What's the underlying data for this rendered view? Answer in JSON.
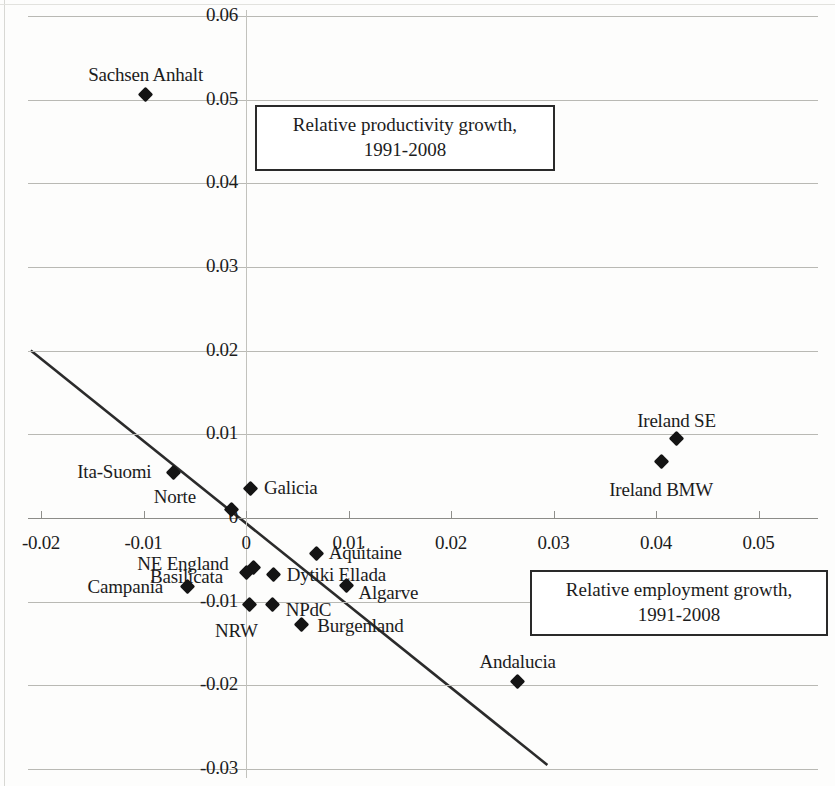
{
  "chart_data": {
    "type": "scatter",
    "title": "",
    "xlabel": "Relative employment growth, 1991-2008",
    "ylabel": "Relative productivity growth, 1991-2008",
    "xlim": [
      -0.02,
      0.05
    ],
    "ylim": [
      -0.03,
      0.06
    ],
    "grid": true,
    "legend": "none",
    "xticks": [
      "-0.02",
      "-0.01",
      "0",
      "0.01",
      "0.02",
      "0.03",
      "0.04",
      "0.05"
    ],
    "xtick_values": [
      -0.02,
      -0.01,
      0,
      0.01,
      0.02,
      0.03,
      0.04,
      0.05
    ],
    "yticks": [
      "0.06",
      "0.05",
      "0.04",
      "0.03",
      "0.02",
      "0.01",
      "0",
      "-0.01",
      "-0.02",
      "-0.03"
    ],
    "ytick_values": [
      0.06,
      0.05,
      0.04,
      0.03,
      0.02,
      0.01,
      0,
      -0.01,
      -0.02,
      -0.03
    ],
    "points": [
      {
        "label": "Sachsen Anhalt",
        "x": -0.0098,
        "y": 0.0506
      },
      {
        "label": "Ireland SE",
        "x": 0.042,
        "y": 0.0095
      },
      {
        "label": "Ireland  BMW",
        "x": 0.0405,
        "y": 0.0068
      },
      {
        "label": "Ita-Suomi",
        "x": -0.0071,
        "y": 0.0054
      },
      {
        "label": "Galicia",
        "x": 0.0004,
        "y": 0.0035
      },
      {
        "label": "Norte",
        "x": -0.0014,
        "y": 0.001
      },
      {
        "label": "Aquitaine",
        "x": 0.0069,
        "y": -0.0043
      },
      {
        "label": "NE England",
        "x": 0.0007,
        "y": -0.0059
      },
      {
        "label": "Basilicata",
        "x": 0.0,
        "y": -0.0065
      },
      {
        "label": "Dytiki Ellada",
        "x": 0.0027,
        "y": -0.0068
      },
      {
        "label": "Campania",
        "x": -0.0057,
        "y": -0.0082
      },
      {
        "label": "Algarve",
        "x": 0.0098,
        "y": -0.0081
      },
      {
        "label": "NRW",
        "x": 0.0003,
        "y": -0.0103
      },
      {
        "label": "NPdC",
        "x": 0.0026,
        "y": -0.0103
      },
      {
        "label": "Burgenland",
        "x": 0.0054,
        "y": -0.0127
      },
      {
        "label": "Andalucia",
        "x": 0.0265,
        "y": -0.0195
      }
    ],
    "trendline": {
      "x_start": -0.021,
      "y_start": 0.02,
      "x_end": 0.0294,
      "y_end": -0.0295
    }
  },
  "axis_titles": {
    "productivity": {
      "line1": "Relative productivity growth,",
      "line2": "1991-2008"
    },
    "employment": {
      "line1": "Relative employment growth,",
      "line2": "1991-2008"
    }
  },
  "ticks": {
    "x": [
      "-0.02",
      "-0.01",
      "0",
      "0.01",
      "0.02",
      "0.03",
      "0.04",
      "0.05"
    ],
    "y": [
      "0.06",
      "0.05",
      "0.04",
      "0.03",
      "0.02",
      "0.01",
      "0",
      "-0.01",
      "-0.02",
      "-0.03"
    ]
  },
  "point_labels": [
    "Sachsen Anhalt",
    "Ireland SE",
    "Ireland  BMW",
    "Ita-Suomi",
    "Galicia",
    "Norte",
    "Aquitaine",
    "NE England",
    "Basilicata",
    "Dytiki Ellada",
    "Campania",
    "Algarve",
    "NRW",
    "NPdC",
    "Burgenland",
    "Andalucia"
  ],
  "colors": {
    "marker": "#141414",
    "grid": "#b9b9b4",
    "trend": "#2b2b2b"
  }
}
